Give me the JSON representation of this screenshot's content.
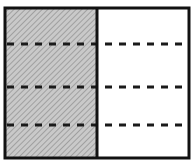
{
  "diagram": {
    "type": "fraction-model",
    "columns": 2,
    "rows": 4,
    "shaded_column": 0,
    "colors": {
      "border": "#111111",
      "dash": "#1a1a1a",
      "shade_base": "#c8c8c8",
      "shade_hatch": "#8a8a8a",
      "background": "#ffffff"
    },
    "geometry": {
      "left": 5,
      "top": 8,
      "right": 189,
      "bottom": 158,
      "divider_x": 97,
      "dash_ys": [
        44,
        87,
        125
      ]
    }
  }
}
